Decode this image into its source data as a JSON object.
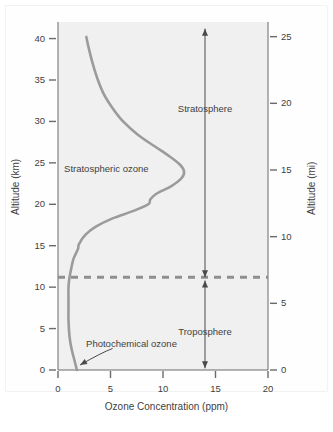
{
  "chart_data": {
    "type": "line",
    "title": "",
    "xlabel": "Ozone Concentration (ppm)",
    "ylabel": "Altitude (km)",
    "y2label": "Altitude (mi)",
    "xlim": [
      0,
      20
    ],
    "ylim": [
      0,
      42
    ],
    "y2lim": [
      0,
      26.1
    ],
    "grid": false,
    "legend": "none",
    "xticks": [
      0,
      5,
      10,
      15,
      20
    ],
    "xtick_labels": [
      "0",
      "5",
      "10",
      "15",
      "20"
    ],
    "yticks": [
      0,
      5,
      10,
      15,
      20,
      25,
      30,
      35,
      40
    ],
    "ytick_labels": [
      "0",
      "5",
      "10",
      "15",
      "20",
      "25",
      "30",
      "35",
      "40"
    ],
    "y2ticks": [
      0,
      5,
      10,
      15,
      20,
      25
    ],
    "y2tick_labels": [
      "0",
      "5",
      "10",
      "15",
      "20",
      "25"
    ],
    "series": [
      {
        "name": "Ozone concentration profile",
        "color": "#9b9b9b",
        "x_is_value": true,
        "points": [
          [
            1.8,
            0.0
          ],
          [
            1.6,
            1.0
          ],
          [
            1.3,
            2.5
          ],
          [
            1.1,
            4.0
          ],
          [
            1.0,
            6.0
          ],
          [
            1.0,
            8.0
          ],
          [
            1.0,
            10.0
          ],
          [
            1.1,
            11.2
          ],
          [
            1.3,
            12.5
          ],
          [
            1.5,
            13.5
          ],
          [
            1.9,
            14.6
          ],
          [
            2.0,
            15.2
          ],
          [
            2.6,
            16.3
          ],
          [
            3.6,
            17.3
          ],
          [
            5.2,
            18.3
          ],
          [
            7.2,
            19.2
          ],
          [
            8.6,
            20.0
          ],
          [
            8.8,
            20.6
          ],
          [
            9.4,
            21.3
          ],
          [
            10.8,
            22.2
          ],
          [
            11.8,
            23.2
          ],
          [
            12.0,
            24.0
          ],
          [
            11.6,
            24.8
          ],
          [
            10.6,
            25.8
          ],
          [
            9.2,
            27.0
          ],
          [
            7.6,
            28.4
          ],
          [
            6.2,
            30.0
          ],
          [
            5.2,
            31.6
          ],
          [
            4.4,
            33.2
          ],
          [
            3.8,
            35.0
          ],
          [
            3.3,
            37.0
          ],
          [
            2.9,
            39.0
          ],
          [
            2.7,
            40.2
          ]
        ]
      }
    ],
    "reference_lines": [
      {
        "name": "tropopause",
        "orientation": "horizontal",
        "value": 11.2,
        "style": "dashed",
        "color": "#8f8f8f"
      }
    ],
    "annotations": [
      {
        "name": "stratospheric-ozone-label",
        "text": "Stratospheric ozone",
        "x": 4.6,
        "y": 24.2
      },
      {
        "name": "photochemical-ozone-label",
        "text": "Photochemical ozone",
        "x": 7.0,
        "y": 3.1
      },
      {
        "name": "stratosphere-label",
        "text": "Stratosphere",
        "x": 14.0,
        "y": 31.5
      },
      {
        "name": "troposphere-label",
        "text": "Troposphere",
        "x": 14.0,
        "y": 4.6
      }
    ],
    "range_arrows": [
      {
        "name": "stratosphere-extent-arrow",
        "x": 14.0,
        "y_from": 11.2,
        "y_to": 41.2,
        "double_headed": true
      },
      {
        "name": "troposphere-extent-arrow",
        "x": 14.0,
        "y_from": 0.2,
        "y_to": 10.8,
        "double_headed": true
      }
    ],
    "pointer_arrow": {
      "name": "photochemical-ozone-pointer",
      "from_x": 5.2,
      "from_y": 2.6,
      "to_x": 2.1,
      "to_y": 0.6
    }
  },
  "axes": {
    "x_title": "Ozone Concentration (ppm)",
    "y_left_title": "Altitude (km)",
    "y_right_title": "Altitude (mi)"
  },
  "colors": {
    "curve": "#9b9b9b",
    "tropopause": "#8f8f8f",
    "axis": "#555555",
    "text": "#3f3f3f",
    "plot_background": "#f0f0f0",
    "page_background": "#ffffff"
  }
}
